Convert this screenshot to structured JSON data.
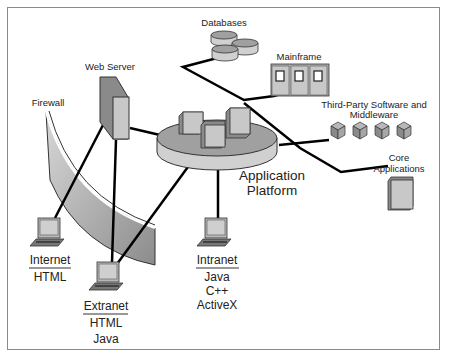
{
  "diagram": {
    "center": {
      "label_line1": "Application",
      "label_line2": "Platform"
    },
    "backend": {
      "databases": {
        "label": "Databases"
      },
      "mainframe": {
        "label": "Mainframe"
      },
      "third_party": {
        "label_line1": "Third-Party Software and",
        "label_line2": "Middleware"
      },
      "core_apps": {
        "label_line1": "Core",
        "label_line2": "Applications"
      }
    },
    "frontend": {
      "web_server": {
        "label": "Web Server"
      },
      "firewall": {
        "label": "Firewall"
      },
      "internet": {
        "title": "Internet",
        "techs": [
          "HTML"
        ]
      },
      "extranet": {
        "title": "Extranet",
        "techs": [
          "HTML",
          "Java"
        ]
      },
      "intranet": {
        "title": "Intranet",
        "techs": [
          "Java",
          "C++",
          "ActiveX"
        ]
      }
    },
    "colors": {
      "line": "#000000",
      "box_front": "#c8c8c8",
      "box_side": "#8a8a8a",
      "disk_top": "#a0a0a0",
      "disk_side": "#d0d0d0",
      "border": "#8a8a8a"
    }
  }
}
